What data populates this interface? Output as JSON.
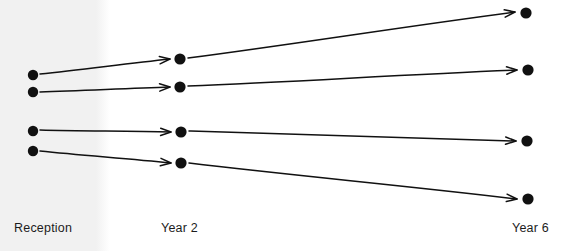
{
  "figure": {
    "type": "progression-arrow-diagram",
    "background_color": "#ffffff",
    "ink_color": "#111111",
    "shaded_band": {
      "name": "left-shaded-band",
      "color": "#f1f1f1",
      "x": 0,
      "width": 106
    }
  },
  "columns": [
    {
      "id": "reception",
      "label": "Reception",
      "label_x": 14,
      "label_y": 222,
      "dot_x": 33
    },
    {
      "id": "year2",
      "label": "Year 2",
      "label_x": 161,
      "label_y": 222,
      "dot_x": 180
    },
    {
      "id": "year6",
      "label": "Year 6",
      "label_x": 512,
      "label_y": 222,
      "dot_x": 527
    }
  ],
  "nodes": {
    "reception": [
      {
        "id": "r1",
        "cx": 33,
        "cy": 75,
        "r": 5.2
      },
      {
        "id": "r2",
        "cx": 33,
        "cy": 92,
        "r": 5.2
      },
      {
        "id": "r3",
        "cx": 33,
        "cy": 131,
        "r": 5.2
      },
      {
        "id": "r4",
        "cx": 33,
        "cy": 151,
        "r": 5.2
      }
    ],
    "year2": [
      {
        "id": "y2a",
        "cx": 180,
        "cy": 59,
        "r": 5.6
      },
      {
        "id": "y2b",
        "cx": 180,
        "cy": 87,
        "r": 5.6
      },
      {
        "id": "y2c",
        "cx": 181,
        "cy": 132,
        "r": 5.6
      },
      {
        "id": "y2d",
        "cx": 181,
        "cy": 163,
        "r": 5.6
      }
    ],
    "year6": [
      {
        "id": "y6a",
        "cx": 526,
        "cy": 13,
        "r": 5.6
      },
      {
        "id": "y6b",
        "cx": 528,
        "cy": 70,
        "r": 5.6
      },
      {
        "id": "y6c",
        "cx": 527,
        "cy": 141,
        "r": 5.6
      },
      {
        "id": "y6d",
        "cx": 528,
        "cy": 199,
        "r": 5.6
      }
    ]
  },
  "arrows": [
    {
      "id": "a1",
      "from": "r1",
      "to": "y2a",
      "x1": 40,
      "y1": 74,
      "x2": 170,
      "y2": 59,
      "trend": "up"
    },
    {
      "id": "a2",
      "from": "r2",
      "to": "y2b",
      "x1": 40,
      "y1": 92,
      "x2": 170,
      "y2": 87,
      "trend": "up"
    },
    {
      "id": "a3",
      "from": "r3",
      "to": "y2c",
      "x1": 40,
      "y1": 130,
      "x2": 171,
      "y2": 132,
      "trend": "flat"
    },
    {
      "id": "a4",
      "from": "r4",
      "to": "y2d",
      "x1": 40,
      "y1": 151,
      "x2": 171,
      "y2": 163,
      "trend": "down"
    },
    {
      "id": "a5",
      "from": "y2a",
      "to": "y6a",
      "x1": 188,
      "y1": 58,
      "x2": 515,
      "y2": 12,
      "trend": "up"
    },
    {
      "id": "a6",
      "from": "y2b",
      "to": "y6b",
      "x1": 188,
      "y1": 86,
      "x2": 517,
      "y2": 70,
      "trend": "up"
    },
    {
      "id": "a7",
      "from": "y2c",
      "to": "y6c",
      "x1": 189,
      "y1": 131,
      "x2": 516,
      "y2": 141,
      "trend": "flat"
    },
    {
      "id": "a8",
      "from": "y2d",
      "to": "y6d",
      "x1": 189,
      "y1": 163,
      "x2": 517,
      "y2": 199,
      "trend": "down"
    }
  ]
}
